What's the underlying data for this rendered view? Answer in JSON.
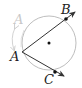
{
  "diagram": {
    "type": "inscribed-angle",
    "colors": {
      "circle": "#b5b5b5",
      "lines": "#333333",
      "faded": "#c8c8c8",
      "points": "#111111"
    },
    "circle": {
      "cx": 49,
      "cy": 43,
      "r": 27
    },
    "center_point": {
      "x": 49,
      "y": 43
    },
    "points": [
      {
        "name": "A",
        "x": 22,
        "y": 52
      },
      {
        "name": "B",
        "x": 66,
        "y": 19
      },
      {
        "name": "C",
        "x": 55,
        "y": 72
      }
    ],
    "labels": {
      "A": "A",
      "B": "B",
      "C": "C",
      "A_faded": "A"
    },
    "rays": [
      {
        "from": "A",
        "through": "B"
      },
      {
        "from": "A",
        "through": "C"
      }
    ],
    "motion_arrow": {
      "description": "double-headed curved arrow indicating A moves along the circle"
    }
  }
}
